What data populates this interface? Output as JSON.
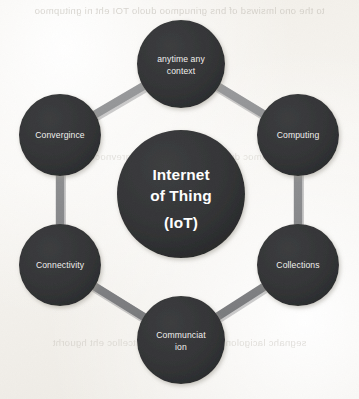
{
  "diagram": {
    "type": "cycle-hub-and-spoke",
    "shape": "hexagon-ring",
    "node_count": 6,
    "colors": {
      "node_fill": "#333436",
      "node_fill_dark": "#2b2c2e",
      "ring": "#8c8d8f",
      "ring_shadow": "#6f7072",
      "label_text": "#f2f1ef",
      "center_text": "#ffffff",
      "page_background": "#f4f2ee",
      "bleed_text": "#b9b4ab"
    },
    "center": {
      "name": "internet-of-things-hub",
      "lines": [
        "Internet",
        "of Thing",
        "(IoT)"
      ],
      "full_text": "Internet of Thing (IoT)"
    },
    "nodes": [
      {
        "id": "anytime-any-context",
        "lines": [
          "anytime any",
          "context"
        ],
        "full_text": "anytime any context",
        "position": "top",
        "cx": 181,
        "cy": 64,
        "r": 44
      },
      {
        "id": "computing",
        "lines": [
          "Computing"
        ],
        "full_text": "Computing",
        "position": "top-right",
        "cx": 298,
        "cy": 135,
        "r": 41
      },
      {
        "id": "collections",
        "lines": [
          "Collections"
        ],
        "full_text": "Collections",
        "position": "bottom-right",
        "cx": 298,
        "cy": 265,
        "r": 41
      },
      {
        "id": "communciation",
        "lines": [
          "Communciat",
          "ion"
        ],
        "full_text": "Communciat ion",
        "position": "bottom",
        "cx": 181,
        "cy": 340,
        "r": 44
      },
      {
        "id": "connectivity",
        "lines": [
          "Connectivity"
        ],
        "full_text": "Connectivity",
        "position": "bottom-left",
        "cx": 60,
        "cy": 265,
        "r": 41
      },
      {
        "id": "convergince",
        "lines": [
          "Convergince"
        ],
        "full_text": "Convergince",
        "position": "top-left",
        "cx": 60,
        "cy": 135,
        "r": 41
      }
    ],
    "background_bleed": {
      "top": "to the  ono lmsiwsd  of  bns  grinuqmoo  duolo  TOI  eht  ni  gnitupmoo",
      "middle": "noitacinummoc  dna  ytivitcennoc  fo  ecnegrevnoc  eht  si  TOI",
      "bottom": "segnahc  lacigolonhcet  dna  atad  fo  noitcelloc  eht  hguorht"
    }
  }
}
